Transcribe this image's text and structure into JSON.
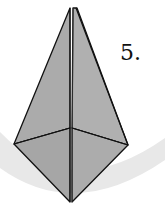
{
  "diagram": {
    "type": "origami-step",
    "step_label": "5.",
    "colors": {
      "paper_fill": "#a9a9a9",
      "paper_fill_light": "#b3b3b3",
      "outline": "#111111",
      "background_arc": "#e8e8e8",
      "background": "#ffffff"
    }
  }
}
